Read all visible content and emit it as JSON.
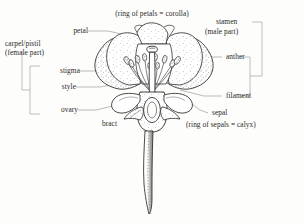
{
  "diagram": {
    "background_color": "#fdfdfc",
    "ink_color": "#2a2a28",
    "leader_color": "#6f6f6c"
  },
  "labels": {
    "corolla_note": "(ring of petals = corolla)",
    "petal": "petal",
    "carpel_line1": "carpel/pistil",
    "carpel_line2": "(female part)",
    "stigma": "stigma",
    "style": "style",
    "ovary": "ovary",
    "bract": "bract",
    "stamen_line1": "stamen",
    "stamen_line2": "(male part)",
    "anther": "anther",
    "filament": "filament",
    "sepal": "sepal",
    "calyx_note": "(ring of sepals = calyx)"
  },
  "groups": {
    "female_parts": [
      "stigma",
      "style",
      "ovary"
    ],
    "male_parts": [
      "anther",
      "filament"
    ]
  },
  "parts_depicted": [
    "petal",
    "stigma",
    "style",
    "ovary",
    "anther",
    "filament",
    "sepal",
    "bract",
    "peduncle"
  ]
}
